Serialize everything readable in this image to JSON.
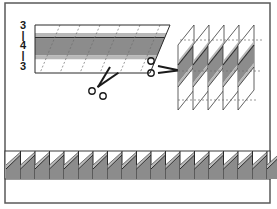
{
  "diagram": {
    "strip_widths": [
      "3",
      "|",
      "4",
      "|",
      "3"
    ],
    "colors": {
      "frame": "#5a5a5a",
      "background": "#ffffff",
      "white_fabric": "#ffffff",
      "light_fabric": "#b8b8b8",
      "dark_fabric": "#8c8c8c",
      "outline": "#2a2a2a",
      "dashed_line": "#6e6e6e"
    },
    "steps": [
      {
        "id": "strip-set",
        "label": "Sew strips together, cut diagonally"
      },
      {
        "id": "segments",
        "label": "Stacked diagonal segments",
        "count": 5
      },
      {
        "id": "border",
        "label": "Sawtooth border row",
        "units": 20
      }
    ]
  }
}
